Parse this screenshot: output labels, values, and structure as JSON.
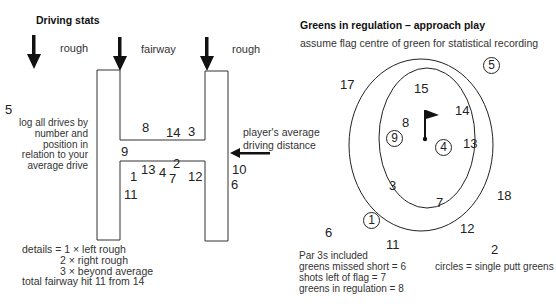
{
  "driving": {
    "title": "Driving stats",
    "zones": {
      "left_rough": "rough",
      "fairway": "fairway",
      "right_rough": "rough"
    },
    "average_label": "player's average\ndriving distance",
    "average_line1": "player's average",
    "average_line2": "driving distance",
    "instructions": [
      "log all drives by",
      "number and",
      "position in",
      "relation to your",
      "average drive"
    ],
    "drives": [
      {
        "n": "5",
        "x": 5,
        "y": 103
      },
      {
        "n": "8",
        "x": 142,
        "y": 121
      },
      {
        "n": "14",
        "x": 166,
        "y": 126
      },
      {
        "n": "3",
        "x": 188,
        "y": 125
      },
      {
        "n": "9",
        "x": 121,
        "y": 145
      },
      {
        "n": "13",
        "x": 141,
        "y": 163
      },
      {
        "n": "4",
        "x": 159,
        "y": 166
      },
      {
        "n": "2",
        "x": 173,
        "y": 157
      },
      {
        "n": "7",
        "x": 169,
        "y": 172
      },
      {
        "n": "1",
        "x": 130,
        "y": 170
      },
      {
        "n": "12",
        "x": 188,
        "y": 170
      },
      {
        "n": "11",
        "x": 124,
        "y": 188
      },
      {
        "n": "10",
        "x": 232,
        "y": 163
      },
      {
        "n": "6",
        "x": 231,
        "y": 178
      }
    ],
    "details": {
      "line1": "details = 1 × left rough",
      "line2": "2 × right rough",
      "line3": "3 × beyond average",
      "line4": "total fairway hit  11 from 14"
    }
  },
  "greens": {
    "title": "Greens in regulation – approach play",
    "subtitle": "assume flag centre of green for statistical recording",
    "shots": [
      {
        "n": "17",
        "x": 340,
        "y": 78,
        "circled": false
      },
      {
        "n": "15",
        "x": 414,
        "y": 82,
        "circled": false
      },
      {
        "n": "5",
        "x": 483,
        "y": 57,
        "circled": true
      },
      {
        "n": "14",
        "x": 455,
        "y": 104,
        "circled": false
      },
      {
        "n": "8",
        "x": 402,
        "y": 116,
        "circled": false
      },
      {
        "n": "9",
        "x": 386,
        "y": 130,
        "circled": true
      },
      {
        "n": "4",
        "x": 435,
        "y": 139,
        "circled": true
      },
      {
        "n": "13",
        "x": 463,
        "y": 137,
        "circled": false
      },
      {
        "n": "3",
        "x": 389,
        "y": 179,
        "circled": false
      },
      {
        "n": "7",
        "x": 436,
        "y": 196,
        "circled": false
      },
      {
        "n": "18",
        "x": 497,
        "y": 189,
        "circled": false
      },
      {
        "n": "1",
        "x": 363,
        "y": 212,
        "circled": true
      },
      {
        "n": "12",
        "x": 460,
        "y": 222,
        "circled": false
      },
      {
        "n": "6",
        "x": 325,
        "y": 226,
        "circled": false
      },
      {
        "n": "11",
        "x": 386,
        "y": 238,
        "circled": false
      },
      {
        "n": "2",
        "x": 491,
        "y": 243,
        "circled": false
      }
    ],
    "notes": [
      "Par 3s included",
      "greens missed short = 6",
      "shots left of flag = 7",
      "greens in regulation = 8"
    ],
    "legend": "circles = single putt greens"
  }
}
